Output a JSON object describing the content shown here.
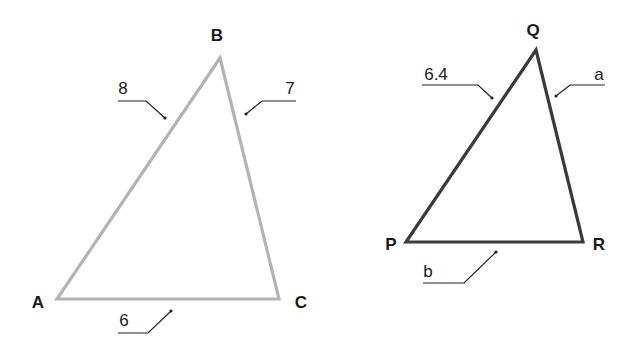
{
  "colors": {
    "triangle_abc": "#b3b3b3",
    "triangle_pqr": "#3a3a3a",
    "text": "#1a1a1a"
  },
  "triangle_abc": {
    "vertices": {
      "A": "A",
      "B": "B",
      "C": "C"
    },
    "sides": {
      "AB": "8",
      "BC": "7",
      "AC": "6"
    }
  },
  "triangle_pqr": {
    "vertices": {
      "P": "P",
      "Q": "Q",
      "R": "R"
    },
    "sides": {
      "PQ": "6.4",
      "QR": "a",
      "PR": "b"
    }
  }
}
